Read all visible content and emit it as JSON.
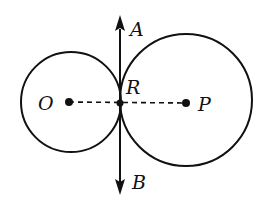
{
  "diagram": {
    "type": "geometry",
    "colors": {
      "stroke": "#111111",
      "background": "#ffffff"
    },
    "circles": [
      {
        "name": "circle-O",
        "center_label": "O",
        "cx": 71,
        "cy": 102,
        "r": 50
      },
      {
        "name": "circle-P",
        "center_label": "P",
        "cx": 185,
        "cy": 100,
        "r": 66
      }
    ],
    "points": {
      "O": {
        "label": "O",
        "x": 69,
        "y": 102
      },
      "P": {
        "label": "P",
        "x": 186,
        "y": 103
      },
      "R": {
        "label": "R",
        "x": 120,
        "y": 103
      }
    },
    "tangent_line": {
      "label_top": "A",
      "label_bottom": "B",
      "x": 120,
      "y_top": 15,
      "y_bottom": 195
    },
    "center_line": {
      "from": "O",
      "to": "P",
      "style": "dashed"
    }
  }
}
